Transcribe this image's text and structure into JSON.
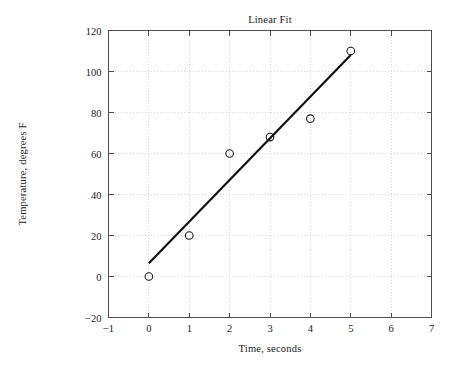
{
  "chart_data": {
    "type": "scatter",
    "title": "Linear Fit",
    "xlabel": "Time, seconds",
    "ylabel": "Temperature, degrees F",
    "xlim": [
      -1,
      7
    ],
    "ylim": [
      -20,
      120
    ],
    "xticks": [
      -1,
      0,
      1,
      2,
      3,
      4,
      5,
      6,
      7
    ],
    "xtick_labels": [
      "-1",
      "0",
      "1",
      "2",
      "3",
      "4",
      "5",
      "6",
      "7"
    ],
    "yticks": [
      -20,
      0,
      20,
      40,
      60,
      80,
      100,
      120
    ],
    "ytick_labels": [
      "-20",
      "0",
      "20",
      "40",
      "60",
      "80",
      "100",
      "120"
    ],
    "grid": true,
    "legend": "none",
    "series": [
      {
        "name": "Measured data",
        "type": "scatter",
        "marker": "open-circle",
        "color": "#1a1a1a",
        "x": [
          0,
          1,
          2,
          3,
          4,
          5
        ],
        "values": [
          0,
          20,
          60,
          68,
          77,
          110
        ]
      },
      {
        "name": "Linear fit",
        "type": "line",
        "color": "#111111",
        "x": [
          0,
          5
        ],
        "values": [
          6.5,
          108
        ],
        "slope": 20.3,
        "intercept": 6.5
      }
    ]
  }
}
